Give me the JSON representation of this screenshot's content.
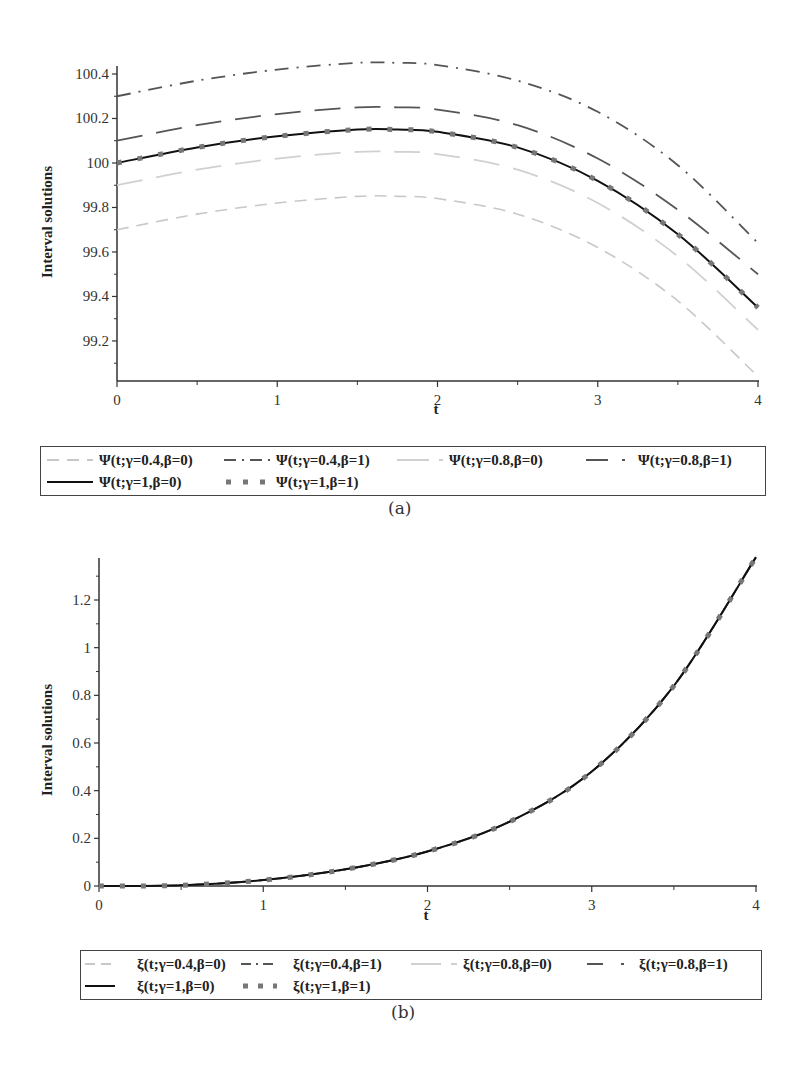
{
  "figures": {
    "a": {
      "caption": "(a)",
      "ylabel": "Interval solutions",
      "xlabel": "t",
      "xticks": [
        "0",
        "1",
        "2",
        "3",
        "4"
      ],
      "yticks": [
        "99.2",
        "99.4",
        "99.6",
        "99.8",
        "100",
        "100.2",
        "100.4"
      ],
      "legend": [
        "Ψ(t;γ=0.4,β=0)",
        "Ψ(t;γ=0.4,β=1)",
        "Ψ(t;γ=0.8,β=0)",
        "Ψ(t;γ=0.8,β=1)",
        "Ψ(t;γ=1,β=0)",
        "Ψ(t;γ=1,β=1)"
      ]
    },
    "b": {
      "caption": "(b)",
      "ylabel": "Interval solutions",
      "xlabel": "t",
      "xticks": [
        "0",
        "1",
        "2",
        "3",
        "4"
      ],
      "yticks": [
        "0",
        "0.2",
        "0.4",
        "0.6",
        "0.8",
        "1",
        "1.2"
      ],
      "legend": [
        "ξ(t;γ=0.4,β=0)",
        "ξ(t;γ=0.4,β=1)",
        "ξ(t;γ=0.8,β=0)",
        "ξ(t;γ=0.8,β=1)",
        "ξ(t;γ=1,β=0)",
        "ξ(t;γ=1,β=1)"
      ]
    }
  },
  "chart_data": [
    {
      "type": "line",
      "title": "(a)",
      "xlabel": "t",
      "ylabel": "Interval solutions",
      "xlim": [
        0,
        4
      ],
      "ylim": [
        99.03,
        100.45
      ],
      "grid": false,
      "legend_position": "bottom",
      "x": [
        0,
        0.5,
        1,
        1.5,
        1.75,
        2,
        2.5,
        3,
        3.5,
        4
      ],
      "series": [
        {
          "name": "Ψ(t;γ=0.4,β=0)",
          "style": "dash",
          "color": "#c8c8c8",
          "values": [
            99.7,
            99.77,
            99.82,
            99.85,
            99.85,
            99.84,
            99.77,
            99.62,
            99.38,
            99.04
          ]
        },
        {
          "name": "Ψ(t;γ=0.4,β=1)",
          "style": "dashdot",
          "color": "#555555",
          "values": [
            100.3,
            100.37,
            100.42,
            100.45,
            100.45,
            100.44,
            100.37,
            100.23,
            99.99,
            99.64
          ]
        },
        {
          "name": "Ψ(t;γ=0.8,β=0)",
          "style": "longdash",
          "color": "#d0d0d0",
          "values": [
            99.9,
            99.97,
            100.02,
            100.05,
            100.05,
            100.04,
            99.97,
            99.82,
            99.58,
            99.25
          ]
        },
        {
          "name": "Ψ(t;γ=0.8,β=1)",
          "style": "longdash",
          "color": "#555555",
          "values": [
            100.1,
            100.17,
            100.22,
            100.25,
            100.25,
            100.24,
            100.17,
            100.02,
            99.79,
            99.5
          ]
        },
        {
          "name": "Ψ(t;γ=1,β=0)",
          "style": "solid",
          "color": "#111111",
          "values": [
            100.0,
            100.07,
            100.12,
            100.15,
            100.15,
            100.14,
            100.07,
            99.92,
            99.68,
            99.35
          ]
        },
        {
          "name": "Ψ(t;γ=1,β=1)",
          "style": "dot",
          "color": "#777777",
          "values": [
            100.0,
            100.07,
            100.12,
            100.15,
            100.15,
            100.14,
            100.07,
            99.92,
            99.68,
            99.35
          ]
        }
      ]
    },
    {
      "type": "line",
      "title": "(b)",
      "xlabel": "t",
      "ylabel": "Interval solutions",
      "xlim": [
        0,
        4
      ],
      "ylim": [
        0,
        1.38
      ],
      "grid": false,
      "legend_position": "bottom",
      "x": [
        0,
        0.5,
        1,
        1.5,
        2,
        2.5,
        3,
        3.5,
        4
      ],
      "series": [
        {
          "name": "ξ(t;γ=0.4,β=0)",
          "style": "dash",
          "color": "#c8c8c8",
          "values": [
            0,
            0.003,
            0.025,
            0.07,
            0.145,
            0.27,
            0.48,
            0.84,
            1.38
          ]
        },
        {
          "name": "ξ(t;γ=0.4,β=1)",
          "style": "dashdot",
          "color": "#555555",
          "values": [
            0,
            0.003,
            0.025,
            0.07,
            0.145,
            0.27,
            0.48,
            0.84,
            1.38
          ]
        },
        {
          "name": "ξ(t;γ=0.8,β=0)",
          "style": "longdash",
          "color": "#d0d0d0",
          "values": [
            0,
            0.003,
            0.025,
            0.07,
            0.145,
            0.27,
            0.48,
            0.84,
            1.38
          ]
        },
        {
          "name": "ξ(t;γ=0.8,β=1)",
          "style": "longdash",
          "color": "#555555",
          "values": [
            0,
            0.003,
            0.025,
            0.07,
            0.145,
            0.27,
            0.48,
            0.84,
            1.38
          ]
        },
        {
          "name": "ξ(t;γ=1,β=0)",
          "style": "solid",
          "color": "#111111",
          "values": [
            0,
            0.003,
            0.025,
            0.07,
            0.145,
            0.27,
            0.48,
            0.84,
            1.38
          ]
        },
        {
          "name": "ξ(t;γ=1,β=1)",
          "style": "dot",
          "color": "#777777",
          "values": [
            0,
            0.003,
            0.025,
            0.07,
            0.145,
            0.27,
            0.48,
            0.84,
            1.38
          ]
        }
      ]
    }
  ]
}
